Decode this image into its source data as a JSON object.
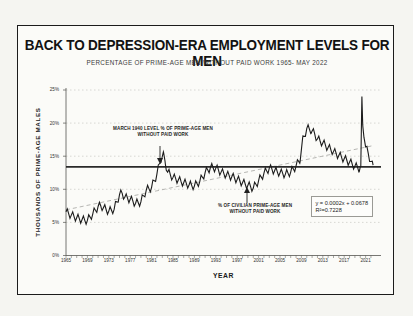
{
  "chart": {
    "title": "BACK TO DEPRESSION-ERA EMPLOYMENT LEVELS FOR MEN",
    "subtitle": "PERCENTAGE OF PRIME-AGE MEN WITHOUT PAID WORK 1965- MAY 2022",
    "x_axis_label": "YEAR",
    "y_axis_label": "THOUSANDS OF PRIME-AGE MALES",
    "annotation_1940_line1": "MARCH 1940 LEVEL % OF PRIME-AGE MEN",
    "annotation_1940_line2": "WITHOUT PAID WORK",
    "annotation_civilian_line1": "% OF CIVILIAN PRIME-AGE MEN",
    "annotation_civilian_line2": "WITHOUT PAID WORK",
    "equation_line1": "y = 0.0002x + 0.0678",
    "equation_line2": "R²=0.7228",
    "colors": {
      "series": "#1c1c1c",
      "reference_line": "#2a2a2a",
      "trendline": "#aeaeaa",
      "gridline": "#c9c9c4",
      "axis": "#555550",
      "border": "#1b1b1b"
    }
  },
  "chart_data": {
    "type": "line",
    "title": "BACK TO DEPRESSION-ERA EMPLOYMENT LEVELS FOR MEN",
    "xlabel": "YEAR",
    "ylabel": "THOUSANDS OF PRIME-AGE MALES",
    "xlim": [
      1965,
      2022.5
    ],
    "ylim": [
      0,
      25
    ],
    "y_ticks": [
      {
        "value": 25,
        "label": "25%"
      },
      {
        "value": 20,
        "label": "20%"
      },
      {
        "value": 15,
        "label": "15%"
      },
      {
        "value": 10,
        "label": "10%"
      },
      {
        "value": 5,
        "label": "5%"
      },
      {
        "value": 0,
        "label": "0%"
      }
    ],
    "x_ticks": [
      1965,
      1969,
      1973,
      1977,
      1981,
      1985,
      1989,
      1993,
      1997,
      2001,
      2005,
      2009,
      2013,
      2017,
      2021
    ],
    "grid": "dotted-horizontal",
    "series": [
      {
        "name": "% of civilian prime-age men without paid work",
        "points": [
          [
            1965,
            6.6
          ],
          [
            1965.5,
            6.3
          ],
          [
            1966,
            6.1
          ],
          [
            1967,
            5.7
          ],
          [
            1968,
            5.4
          ],
          [
            1969,
            5.3
          ],
          [
            1970,
            6.3
          ],
          [
            1971,
            7.4
          ],
          [
            1971.6,
            7.5
          ],
          [
            1972,
            7.2
          ],
          [
            1973,
            6.7
          ],
          [
            1974,
            7.0
          ],
          [
            1975,
            9.2
          ],
          [
            1975.5,
            9.4
          ],
          [
            1976,
            8.8
          ],
          [
            1977,
            8.5
          ],
          [
            1978,
            7.9
          ],
          [
            1979,
            8.1
          ],
          [
            1980,
            9.9
          ],
          [
            1981,
            10.3
          ],
          [
            1982,
            12.3
          ],
          [
            1982.8,
            14.8
          ],
          [
            1983.2,
            15.1
          ],
          [
            1983.6,
            14.0
          ],
          [
            1984,
            12.6
          ],
          [
            1985,
            11.8
          ],
          [
            1986,
            11.4
          ],
          [
            1987,
            11.0
          ],
          [
            1988,
            10.7
          ],
          [
            1989,
            10.5
          ],
          [
            1990,
            11.2
          ],
          [
            1991,
            12.5
          ],
          [
            1992,
            13.3
          ],
          [
            1993,
            13.2
          ],
          [
            1994,
            12.6
          ],
          [
            1995,
            12.2
          ],
          [
            1996,
            11.9
          ],
          [
            1997,
            11.5
          ],
          [
            1998,
            11.0
          ],
          [
            1999,
            10.6
          ],
          [
            2000,
            10.2
          ],
          [
            2001,
            11.3
          ],
          [
            2002,
            12.4
          ],
          [
            2003,
            13.2
          ],
          [
            2004,
            12.8
          ],
          [
            2005,
            12.5
          ],
          [
            2006,
            12.3
          ],
          [
            2007,
            12.6
          ],
          [
            2008,
            13.5
          ],
          [
            2008.7,
            14.5
          ],
          [
            2009.3,
            17.5
          ],
          [
            2010,
            19.2
          ],
          [
            2010.8,
            19.0
          ],
          [
            2011.5,
            18.3
          ],
          [
            2012,
            17.6
          ],
          [
            2013,
            17.0
          ],
          [
            2014,
            16.3
          ],
          [
            2015,
            15.7
          ],
          [
            2016,
            15.1
          ],
          [
            2017,
            14.6
          ],
          [
            2018,
            14.1
          ],
          [
            2019,
            13.5
          ],
          [
            2019.8,
            13.2
          ],
          [
            2020.1,
            13.5
          ],
          [
            2020.3,
            24.0
          ],
          [
            2020.45,
            19.8
          ],
          [
            2020.7,
            17.8
          ],
          [
            2021,
            16.4
          ],
          [
            2021.5,
            15.4
          ],
          [
            2022,
            14.2
          ],
          [
            2022.4,
            13.3
          ]
        ]
      }
    ],
    "seasonal_oscillation_pct": 0.6,
    "reference_line": {
      "label": "March 1940 level % of prime-age men without paid work",
      "value": 13.4
    },
    "trendline": {
      "start": [
        1965,
        6.9
      ],
      "end": [
        2022.4,
        16.6
      ],
      "equation": "y = 0.0002x + 0.0678",
      "r_squared": 0.7228
    },
    "annotations": [
      {
        "text": "MARCH 1940 LEVEL % OF PRIME-AGE MEN WITHOUT PAID WORK",
        "arrow": "down",
        "arrow_x": 1983,
        "points_to": "reference line"
      },
      {
        "text": "% OF CIVILIAN PRIME-AGE MEN WITHOUT PAID WORK",
        "arrow": "up",
        "arrow_x": 2000,
        "points_to": "data series"
      }
    ]
  }
}
